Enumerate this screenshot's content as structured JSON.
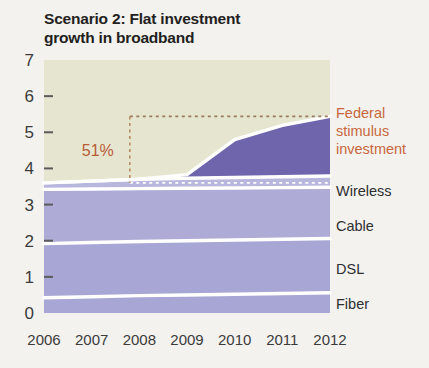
{
  "figure": {
    "title": "Scenario 2: Flat investment\ngrowth in broadband",
    "background_color": "#f3f2ef"
  },
  "chart_data": {
    "type": "area",
    "stacked": true,
    "title": "Scenario 2: Flat investment growth in broadband",
    "xlabel": "",
    "ylabel": "",
    "x": [
      2006,
      2007,
      2008,
      2009,
      2010,
      2011,
      2012
    ],
    "categories": [
      "2006",
      "2007",
      "2008",
      "2009",
      "2010",
      "2011",
      "2012"
    ],
    "xlim": [
      2006,
      2012
    ],
    "ylim": [
      0,
      7
    ],
    "yticks": [
      0,
      1,
      2,
      3,
      4,
      5,
      6,
      7
    ],
    "ytick_labels": [
      "0",
      "1",
      "2",
      "3",
      "4",
      "5",
      "6",
      "7"
    ],
    "grid": false,
    "legend_position": "right-inline",
    "series": [
      {
        "name": "Fiber",
        "color": "#a8a6d4",
        "values": [
          0.42,
          0.45,
          0.48,
          0.5,
          0.52,
          0.54,
          0.56
        ]
      },
      {
        "name": "DSL",
        "color": "#a8a6d4",
        "values": [
          1.5,
          1.5,
          1.5,
          1.5,
          1.5,
          1.5,
          1.5
        ]
      },
      {
        "name": "Cable",
        "color": "#aeabd6",
        "values": [
          1.5,
          1.48,
          1.46,
          1.45,
          1.44,
          1.43,
          1.42
        ]
      },
      {
        "name": "Wireless",
        "color": "#b9b6dd",
        "values": [
          0.18,
          0.22,
          0.26,
          0.28,
          0.29,
          0.3,
          0.31
        ]
      },
      {
        "name": "Federal stimulus investment",
        "color": "#6f65ac",
        "values": [
          0.0,
          0.0,
          0.0,
          0.1,
          1.05,
          1.42,
          1.65
        ]
      }
    ],
    "upper_region": {
      "name": "background",
      "color": "#e6e6d0"
    },
    "annotations": [
      {
        "name": "percent-callout",
        "text": "51%",
        "color": "#b85c37",
        "bracket_top_value": 5.44,
        "bracket_bottom_value": 3.6,
        "bracket_x": 2007.8
      }
    ],
    "series_labels": [
      {
        "text": "Federal\nstimulus\ninvestment",
        "color": "#c8673c"
      },
      {
        "text": "Wireless",
        "color": "#2f2f2f"
      },
      {
        "text": "Cable",
        "color": "#2f2f2f"
      },
      {
        "text": "DSL",
        "color": "#2f2f2f"
      },
      {
        "text": "Fiber",
        "color": "#2f2f2f"
      }
    ]
  },
  "labels": {
    "federal_line1": "Federal",
    "federal_line2": "stimulus",
    "federal_line3": "investment",
    "wireless": "Wireless",
    "cable": "Cable",
    "dsl": "DSL",
    "fiber": "Fiber",
    "percent": "51%"
  },
  "ytick_labels": {
    "t7": "7",
    "t6": "6",
    "t5": "5",
    "t4": "4",
    "t3": "3",
    "t2": "2",
    "t1": "1",
    "t0": "0"
  },
  "xtick_labels": {
    "y2006": "2006",
    "y2007": "2007",
    "y2008": "2008",
    "y2009": "2009",
    "y2010": "2010",
    "y2011": "2011",
    "y2012": "2012"
  },
  "colors": {
    "plot_background": "#e6e6d0",
    "stimulus": "#6f65ac",
    "wireless": "#b9b6dd",
    "cable": "#aeabd6",
    "dsl": "#a8a6d4",
    "fiber": "#a8a6d4",
    "accent_orange": "#c8673c",
    "text": "#2f2f2f",
    "separator": "#ffffff"
  }
}
